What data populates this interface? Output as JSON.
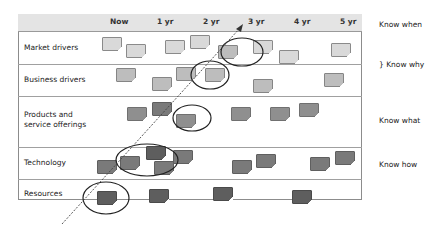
{
  "header": {
    "columns": [
      "Now",
      "1 yr",
      "2 yr",
      "3 yr",
      "4 yr",
      "5 yr"
    ],
    "know_when": "Know when"
  },
  "rows": [
    {
      "label_line1": "Market drivers",
      "label_line2": ""
    },
    {
      "label_line1": "Business drivers",
      "label_line2": ""
    },
    {
      "label_line1": "Products and",
      "label_line2": "service offerings"
    },
    {
      "label_line1": "Technology",
      "label_line2": ""
    },
    {
      "label_line1": "Resources",
      "label_line2": ""
    }
  ],
  "side_labels": {
    "know_why": "} Know why",
    "know_what": "Know what",
    "know_how": "Know how"
  },
  "colors": {
    "frame": "#8c8c8c",
    "header_bg": "#e4e4e4",
    "ellipse": "#222222",
    "arrow": "#444444"
  }
}
